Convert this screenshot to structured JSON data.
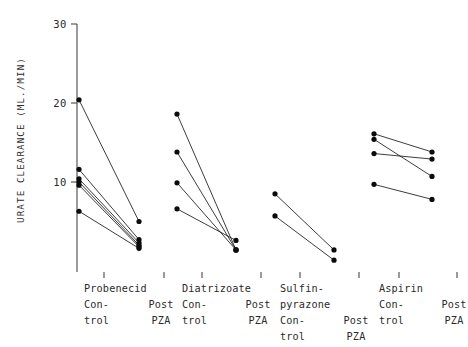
{
  "chart_data": {
    "type": "line",
    "title": "",
    "subtitle": "",
    "xlabel": "",
    "ylabel": "URATE CLEARANCE (ML./MIN)",
    "ylim": [
      0,
      30
    ],
    "yticks": [
      10,
      20,
      30
    ],
    "ytick_labels": [
      "10",
      "20",
      "30"
    ],
    "grid": false,
    "legend": false,
    "legend_position": "none",
    "x_categories": [
      "Probenecid Control",
      "Probenecid Post PZA",
      "Diatrizoate Control",
      "Diatrizoate Post PZA",
      "Sulfinpyrazone Control",
      "Sulfinpyrazone Post PZA",
      "Aspirin Control",
      "Aspirin Post PZA"
    ],
    "groups": [
      {
        "name": "Probenecid",
        "label_lines": [
          "Probenecid"
        ],
        "control_label_lines": [
          "Con-",
          "trol"
        ],
        "post_label_lines": [
          "Post",
          "PZA"
        ],
        "pairs": [
          {
            "control": 20.4,
            "post": 5.0
          },
          {
            "control": 11.6,
            "post": 2.7
          },
          {
            "control": 10.4,
            "post": 2.3
          },
          {
            "control": 10.0,
            "post": 2.0
          },
          {
            "control": 9.6,
            "post": 1.8
          },
          {
            "control": 6.3,
            "post": 1.6
          }
        ]
      },
      {
        "name": "Diatrizoate",
        "label_lines": [
          "Diatrizoate"
        ],
        "control_label_lines": [
          "Con-",
          "trol"
        ],
        "post_label_lines": [
          "Post",
          "PZA"
        ],
        "pairs": [
          {
            "control": 18.6,
            "post": 1.4
          },
          {
            "control": 13.8,
            "post": 1.4
          },
          {
            "control": 9.9,
            "post": 1.4
          },
          {
            "control": 6.6,
            "post": 2.6
          }
        ]
      },
      {
        "name": "Sulfinpyrazone",
        "label_lines": [
          "Sulfin-",
          "pyrazone"
        ],
        "control_label_lines": [
          "Con-",
          "trol"
        ],
        "post_label_lines": [
          "Post",
          "PZA"
        ],
        "pairs": [
          {
            "control": 8.5,
            "post": 1.4
          },
          {
            "control": 5.7,
            "post": 0.1
          }
        ]
      },
      {
        "name": "Aspirin",
        "label_lines": [
          "Aspirin"
        ],
        "control_label_lines": [
          "Con-",
          "trol"
        ],
        "post_label_lines": [
          "Post",
          "PZA"
        ],
        "pairs": [
          {
            "control": 16.1,
            "post": 13.8
          },
          {
            "control": 15.4,
            "post": 10.7
          },
          {
            "control": 13.6,
            "post": 12.9
          },
          {
            "control": 9.7,
            "post": 7.8
          }
        ]
      }
    ],
    "colors": {
      "point": "#0b0b0b",
      "line": "#1a1a1a",
      "axis": "#4a4a4a",
      "text": "#2b2b2b",
      "background": "#ffffff"
    }
  }
}
